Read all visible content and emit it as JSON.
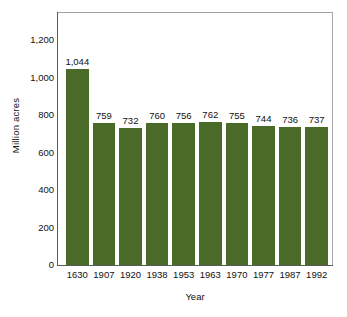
{
  "chart_data": {
    "type": "bar",
    "title": "",
    "subtitle": "",
    "xlabel": "Year",
    "ylabel": "Million acres",
    "categories": [
      "1630",
      "1907",
      "1920",
      "1938",
      "1953",
      "1963",
      "1970",
      "1977",
      "1987",
      "1992"
    ],
    "values": [
      1044,
      759,
      732,
      760,
      756,
      762,
      755,
      744,
      736,
      737
    ],
    "value_labels": [
      "1,044",
      "759",
      "732",
      "760",
      "756",
      "762",
      "755",
      "744",
      "736",
      "737"
    ],
    "ylim": [
      0,
      1200
    ],
    "yticks": [
      0,
      200,
      400,
      600,
      800,
      1000,
      1200
    ],
    "ytick_labels": [
      "0",
      "200",
      "400",
      "600",
      "800",
      "1,000",
      "1,200"
    ],
    "grid": false,
    "legend": "none",
    "bar_color": "#4a6b28",
    "background_color": "#ffffff",
    "frame_color": "#9a9a9a",
    "axis_color": "#5c5c5c",
    "text_color": "#111111"
  }
}
